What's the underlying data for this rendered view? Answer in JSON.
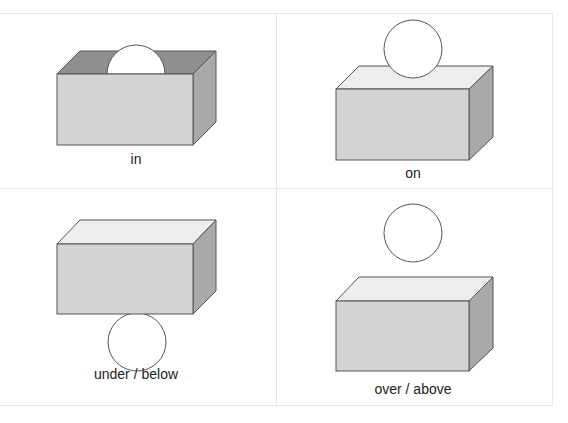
{
  "diagram": {
    "panels": [
      {
        "id": "in",
        "label": "in"
      },
      {
        "id": "on",
        "label": "on"
      },
      {
        "id": "under",
        "label": "under / below"
      },
      {
        "id": "over",
        "label": "over / above"
      }
    ],
    "colors": {
      "front_face": "#d3d3d3",
      "side_face": "#a9a9a9",
      "top_face": "#eeeeee",
      "inside_top": "#8f8f8f",
      "ball": "#ffffff",
      "outline": "#555555",
      "grid": "#e6e6e6"
    }
  }
}
